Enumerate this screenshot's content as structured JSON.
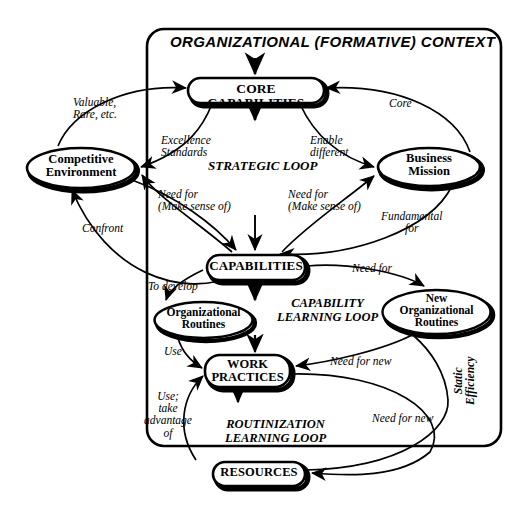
{
  "figure": {
    "context_title": "ORGANIZATIONAL  (FORMATIVE) CONTEXT",
    "background": "#ffffff",
    "ink": "#000000"
  },
  "nodes": {
    "core_capabilities": {
      "label": "CORE CAPABILITIES",
      "shape": "rounded-rect"
    },
    "competitive_environment": {
      "line1": "Competitive",
      "line2": "Environment",
      "shape": "ellipse"
    },
    "business_mission": {
      "line1": "Business",
      "line2": "Mission",
      "shape": "ellipse"
    },
    "capabilities": {
      "label": "CAPABILITIES",
      "shape": "rounded-rect"
    },
    "organizational_routines": {
      "line1": "Organizational",
      "line2": "Routines",
      "shape": "ellipse"
    },
    "new_organizational_routines": {
      "line1": "New",
      "line2": "Organizational",
      "line3": "Routines",
      "shape": "ellipse"
    },
    "work_practices": {
      "line1": "WORK",
      "line2": "PRACTICES",
      "shape": "rounded-rect"
    },
    "resources": {
      "label": "RESOURCES",
      "shape": "rounded-rect"
    }
  },
  "loops": {
    "strategic": "STRATEGIC LOOP",
    "capability_learning_l1": "CAPABILITY",
    "capability_learning_l2": "LEARNING LOOP",
    "routinization_l1": "ROUTINIZATION",
    "routinization_l2": "LEARNING LOOP",
    "static_efficiency_l1": "Static",
    "static_efficiency_l2": "Efficiency"
  },
  "edge_labels": {
    "valuable_rare_l1": "Valuable,",
    "valuable_rare_l2": "Rare, etc.",
    "excellence_l1": "Excellence",
    "excellence_l2": "Standards",
    "enable_l1": "Enable",
    "enable_l2": "different",
    "core": "Core",
    "need_for_make_sense_left_l1": "Need for",
    "need_for_make_sense_left_l2": "(Make sense of)",
    "need_for_make_sense_right_l1": "Need for",
    "need_for_make_sense_right_l2": "(Make sense of)",
    "fundamental_l1": "Fundamental",
    "fundamental_l2": "for",
    "confront": "Confront",
    "to_develop": "To develop",
    "need_for": "Need for",
    "use": "Use",
    "use_take_advantage_l1": "Use;",
    "use_take_advantage_l2": "take",
    "use_take_advantage_l3": "advantage",
    "use_take_advantage_l4": "of",
    "need_for_new_upper": "Need for new",
    "need_for_new_lower": "Need for new"
  }
}
